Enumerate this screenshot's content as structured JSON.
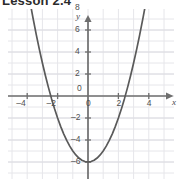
{
  "caption": {
    "text": "Lesson 2.4"
  },
  "chart_data": {
    "type": "line",
    "title": "",
    "subtitle": "",
    "xlabel": "x",
    "ylabel": "y",
    "function": "y = x^2 - 6",
    "vertex": [
      0,
      -6
    ],
    "x_intercepts": [
      -2.45,
      2.45
    ],
    "y_intercept": -6,
    "xlim": [
      -5.2,
      5.0
    ],
    "ylim": [
      -9.6,
      9.6
    ],
    "x_ticks": [
      -4,
      -2,
      0,
      2,
      4
    ],
    "x_tick_labels": [
      "–4",
      "–2",
      "0",
      "2",
      "4"
    ],
    "y_ticks": [
      -8,
      -6,
      -4,
      -2,
      2,
      4,
      6,
      8
    ],
    "y_tick_labels": [
      "–8",
      "–6",
      "–4",
      "–2",
      "2",
      "4",
      "6",
      "8"
    ],
    "origin_label": "0",
    "grid": true,
    "grid_step_x": 1,
    "grid_step_y": 2,
    "legend": null,
    "x": [
      -4.0,
      -3.8,
      -3.6,
      -3.4,
      -3.2,
      -3.0,
      -2.8,
      -2.6,
      -2.4,
      -2.2,
      -2.0,
      -1.8,
      -1.6,
      -1.4,
      -1.2,
      -1.0,
      -0.8,
      -0.6,
      -0.4,
      -0.2,
      0.0,
      0.2,
      0.4,
      0.6,
      0.8,
      1.0,
      1.2,
      1.4,
      1.6,
      1.8,
      2.0,
      2.2,
      2.4,
      2.6,
      2.8,
      3.0,
      3.2,
      3.4,
      3.6,
      3.8,
      4.0
    ],
    "values": [
      10.0,
      8.44,
      6.96,
      5.56,
      4.24,
      3.0,
      1.84,
      0.76,
      -0.24,
      -1.16,
      -2.0,
      -2.76,
      -3.44,
      -4.04,
      -4.56,
      -5.0,
      -5.36,
      -5.64,
      -5.84,
      -5.96,
      -6.0,
      -5.96,
      -5.84,
      -5.64,
      -5.36,
      -5.0,
      -4.56,
      -4.04,
      -3.44,
      -2.76,
      -2.0,
      -1.16,
      -0.24,
      0.76,
      1.84,
      3.0,
      4.24,
      5.56,
      6.96,
      8.44,
      10.0
    ]
  },
  "colors": {
    "curve": "#5a5a5a",
    "axis": "#6e6e6e",
    "grid": "#e2e2e6",
    "grid_major": "#d6d6dc",
    "tick_text": "#4f4f4f",
    "caption_text": "#2b2b2b",
    "background": "#ffffff"
  }
}
